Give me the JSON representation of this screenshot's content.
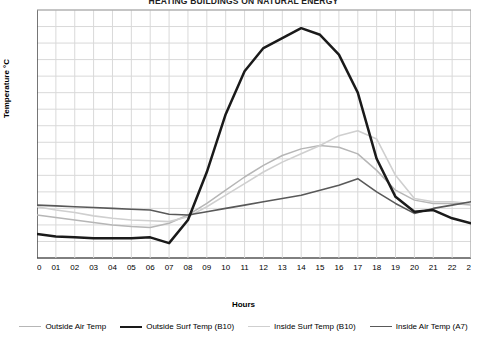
{
  "chart_data": {
    "type": "line",
    "title": "HEATING BUILDINGS ON NATURAL ENERGY",
    "xlabel": "Hours",
    "ylabel": "Temperature °C",
    "grid": true,
    "legend_position": "bottom",
    "xlim": [
      0,
      23
    ],
    "ylim": [
      26,
      56
    ],
    "ytick_step": 2,
    "categories": [
      "00",
      "01",
      "02",
      "03",
      "04",
      "05",
      "06",
      "07",
      "08",
      "09",
      "10",
      "11",
      "12",
      "13",
      "14",
      "15",
      "16",
      "17",
      "18",
      "19",
      "20",
      "21",
      "22",
      "23"
    ],
    "yticks": [
      "26",
      "28",
      "30",
      "32",
      "34",
      "36",
      "38",
      "40",
      "42",
      "44",
      "46",
      "48",
      "50",
      "52",
      "54",
      "56"
    ],
    "series": [
      {
        "name": "Outside Air Temp",
        "color": "#b6b6b6",
        "width": 1.5,
        "values": [
          31.2,
          30.9,
          30.6,
          30.3,
          30.0,
          29.8,
          29.7,
          30.2,
          31.2,
          32.6,
          34.2,
          35.8,
          37.2,
          38.4,
          39.2,
          39.6,
          39.4,
          38.6,
          36.6,
          34.2,
          33.0,
          32.6,
          32.6,
          32.4
        ]
      },
      {
        "name": "Outside Surf Temp (B10)",
        "color": "#1a1a1a",
        "width": 2.5,
        "values": [
          28.9,
          28.6,
          28.5,
          28.4,
          28.4,
          28.4,
          28.5,
          27.8,
          30.6,
          36.4,
          43.4,
          48.6,
          51.4,
          52.6,
          53.8,
          53.0,
          50.6,
          46.0,
          38.0,
          33.4,
          31.6,
          31.8,
          30.8,
          30.2
        ]
      },
      {
        "name": "Inside Surf Temp (B10)",
        "color": "#cfcfcf",
        "width": 1.6,
        "values": [
          32.2,
          31.8,
          31.5,
          31.1,
          30.8,
          30.6,
          30.5,
          30.4,
          31.0,
          32.2,
          33.6,
          35.0,
          36.4,
          37.6,
          38.6,
          39.6,
          40.8,
          41.4,
          40.4,
          36.0,
          33.2,
          32.8,
          32.8,
          32.6
        ]
      },
      {
        "name": "Inside Air Temp (A7)",
        "color": "#595959",
        "width": 1.6,
        "values": [
          32.4,
          32.3,
          32.2,
          32.1,
          32.0,
          31.9,
          31.8,
          31.3,
          31.2,
          31.6,
          32.0,
          32.4,
          32.8,
          33.2,
          33.6,
          34.2,
          34.8,
          35.6,
          34.0,
          32.6,
          31.4,
          32.0,
          32.4,
          32.8
        ]
      }
    ]
  },
  "legend": [
    {
      "label": "Outside Air Temp"
    },
    {
      "label": "Outside Surf Temp (B10)"
    },
    {
      "label": "Inside Surf Temp (B10)"
    },
    {
      "label": "Inside Air Temp (A7)"
    }
  ]
}
